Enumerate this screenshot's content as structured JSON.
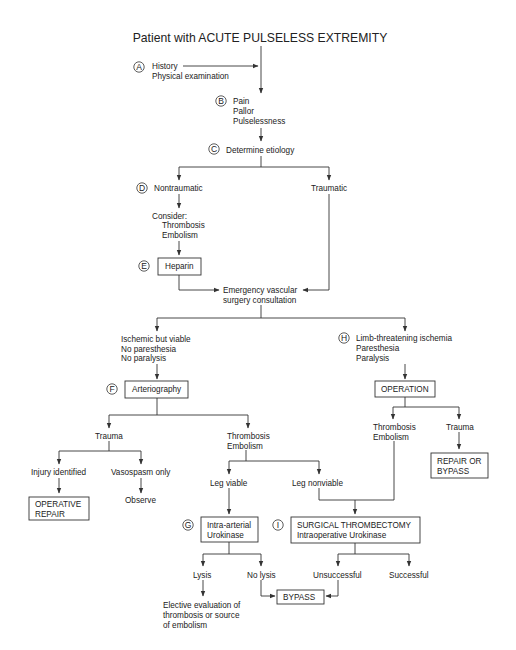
{
  "title": "Patient with ACUTE PULSELESS EXTREMITY",
  "markers": {
    "A": "A",
    "B": "B",
    "C": "C",
    "D": "D",
    "E": "E",
    "F": "F",
    "G": "G",
    "H": "H",
    "I": "I"
  },
  "nodes": {
    "history": [
      "History",
      "Physical examination"
    ],
    "symptoms": [
      "Pain",
      "Pallor",
      "Pulselessness"
    ],
    "etiology": "Determine etiology",
    "nontraumatic": "Nontraumatic",
    "traumatic": "Traumatic",
    "consider": [
      "Consider:",
      "Thrombosis",
      "Embolism"
    ],
    "heparin": "Heparin",
    "consultation": [
      "Emergency vascular",
      "surgery consultation"
    ],
    "viable": [
      "Ischemic but viable",
      "No paresthesia",
      "No paralysis"
    ],
    "threatening": [
      "Limb-threatening ischemia",
      "Paresthesia",
      "Paralysis"
    ],
    "arteriography": "Arteriography",
    "operation": "OPERATION",
    "trauma_left": "Trauma",
    "thrombo_mid": [
      "Thrombosis",
      "Embolism"
    ],
    "thrombo_right": [
      "Thrombosis",
      "Embolism"
    ],
    "trauma_right": "Trauma",
    "repair_bypass": [
      "REPAIR OR",
      "BYPASS"
    ],
    "injury": "Injury identified",
    "vasospasm": "Vasospasm only",
    "operative_repair": [
      "OPERATIVE",
      "REPAIR"
    ],
    "observe": "Observe",
    "leg_viable": "Leg viable",
    "leg_nonviable": "Leg nonviable",
    "urokinase": [
      "Intra-arterial",
      "Urokinase"
    ],
    "thrombectomy": [
      "SURGICAL THROMBECTOMY",
      "Intraoperative Urokinase"
    ],
    "lysis": "Lysis",
    "no_lysis": "No lysis",
    "unsuccessful": "Unsuccessful",
    "successful": "Successful",
    "bypass": "BYPASS",
    "elective": [
      "Elective evaluation of",
      "thrombosis or source",
      "of embolism"
    ]
  },
  "colors": {
    "line": "#333333",
    "text": "#222222",
    "background": "#ffffff"
  }
}
